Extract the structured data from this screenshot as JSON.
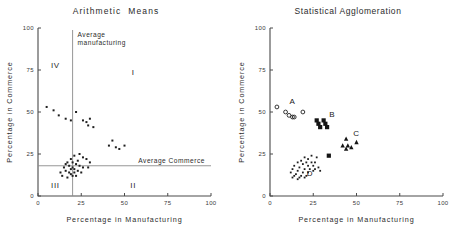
{
  "figure": {
    "panels": [
      "left",
      "right"
    ]
  },
  "left": {
    "title": "Arithmetic  Means",
    "xlabel": "Percentage in Manufacturing",
    "ylabel": "Percentage in Commerce",
    "ticks": [
      "0",
      "25",
      "50",
      "75",
      "100"
    ],
    "annotations": {
      "avg_manufacturing": "Average\nmanufacturing",
      "avg_manufacturing_line1": "Average",
      "avg_manufacturing_line2": "manufacturing",
      "avg_commerce": "Average Commerce"
    },
    "quadrants": {
      "one": "I",
      "two": "II",
      "three": "III",
      "four": "IV"
    }
  },
  "right": {
    "title": "Statistical Agglomeration",
    "xlabel": "Percentage in Manufacturing",
    "ylabel": "Percentage in Commerce",
    "ticks": [
      "0",
      "25",
      "50",
      "75",
      "100"
    ],
    "clusters": {
      "a": "A",
      "b": "B",
      "c": "C",
      "d": "D"
    }
  },
  "chart_data": [
    {
      "type": "scatter",
      "title": "Arithmetic  Means",
      "xlabel": "Percentage in Manufacturing",
      "ylabel": "Percentage in Commerce",
      "xlim": [
        0,
        100
      ],
      "ylim": [
        0,
        100
      ],
      "xticks": [
        0,
        25,
        50,
        75,
        100
      ],
      "yticks": [
        0,
        25,
        50,
        75,
        100
      ],
      "grid": false,
      "legend": "none",
      "reference_lines": [
        {
          "orientation": "vertical",
          "value": 20,
          "label": "Average manufacturing"
        },
        {
          "orientation": "horizontal",
          "value": 18,
          "label": "Average Commerce"
        }
      ],
      "annotations": [
        {
          "text": "IV",
          "x": 10,
          "y": 76
        },
        {
          "text": "I",
          "x": 55,
          "y": 72
        },
        {
          "text": "II",
          "x": 55,
          "y": 5
        },
        {
          "text": "III",
          "x": 10,
          "y": 5
        }
      ],
      "points": [
        {
          "x": 5,
          "y": 53
        },
        {
          "x": 9,
          "y": 51
        },
        {
          "x": 12,
          "y": 48
        },
        {
          "x": 16,
          "y": 46
        },
        {
          "x": 19,
          "y": 45
        },
        {
          "x": 22,
          "y": 50
        },
        {
          "x": 26,
          "y": 45
        },
        {
          "x": 28,
          "y": 44
        },
        {
          "x": 30,
          "y": 46
        },
        {
          "x": 29,
          "y": 42
        },
        {
          "x": 32,
          "y": 41
        },
        {
          "x": 43,
          "y": 33
        },
        {
          "x": 41,
          "y": 30
        },
        {
          "x": 45,
          "y": 29
        },
        {
          "x": 47,
          "y": 28
        },
        {
          "x": 50,
          "y": 30
        },
        {
          "x": 21,
          "y": 24
        },
        {
          "x": 24,
          "y": 25
        },
        {
          "x": 26,
          "y": 23
        },
        {
          "x": 28,
          "y": 22
        },
        {
          "x": 30,
          "y": 20
        },
        {
          "x": 29,
          "y": 17
        },
        {
          "x": 19,
          "y": 22
        },
        {
          "x": 20,
          "y": 20
        },
        {
          "x": 22,
          "y": 19
        },
        {
          "x": 23,
          "y": 21
        },
        {
          "x": 17,
          "y": 20
        },
        {
          "x": 18,
          "y": 18
        },
        {
          "x": 20,
          "y": 17
        },
        {
          "x": 21,
          "y": 16
        },
        {
          "x": 24,
          "y": 18
        },
        {
          "x": 26,
          "y": 17
        },
        {
          "x": 15,
          "y": 17
        },
        {
          "x": 16,
          "y": 15
        },
        {
          "x": 18,
          "y": 14
        },
        {
          "x": 19,
          "y": 13
        },
        {
          "x": 21,
          "y": 14
        },
        {
          "x": 23,
          "y": 15
        },
        {
          "x": 25,
          "y": 14
        },
        {
          "x": 13,
          "y": 14
        },
        {
          "x": 14,
          "y": 12
        },
        {
          "x": 17,
          "y": 11
        },
        {
          "x": 20,
          "y": 12
        },
        {
          "x": 22,
          "y": 12
        },
        {
          "x": 16,
          "y": 19
        },
        {
          "x": 19,
          "y": 16
        }
      ]
    },
    {
      "type": "scatter",
      "title": "Statistical Agglomeration",
      "xlabel": "Percentage in Manufacturing",
      "ylabel": "Percentage in Commerce",
      "xlim": [
        0,
        100
      ],
      "ylim": [
        0,
        100
      ],
      "xticks": [
        0,
        25,
        50,
        75,
        100
      ],
      "yticks": [
        0,
        25,
        50,
        75,
        100
      ],
      "grid": false,
      "legend": "none",
      "annotations": [
        {
          "text": "A",
          "x": 13,
          "y": 55
        },
        {
          "text": "B",
          "x": 36,
          "y": 47
        },
        {
          "text": "C",
          "x": 50,
          "y": 36
        },
        {
          "text": "D",
          "x": 23,
          "y": 12
        }
      ],
      "series": [
        {
          "name": "A",
          "marker": "open-circle",
          "points": [
            {
              "x": 4,
              "y": 53
            },
            {
              "x": 9,
              "y": 50
            },
            {
              "x": 11,
              "y": 48
            },
            {
              "x": 13,
              "y": 47
            },
            {
              "x": 14,
              "y": 47
            },
            {
              "x": 19,
              "y": 50
            }
          ]
        },
        {
          "name": "B",
          "marker": "filled-square",
          "points": [
            {
              "x": 27,
              "y": 45
            },
            {
              "x": 31,
              "y": 45
            },
            {
              "x": 28,
              "y": 43
            },
            {
              "x": 32,
              "y": 43
            },
            {
              "x": 29,
              "y": 41
            },
            {
              "x": 33,
              "y": 41
            },
            {
              "x": 34,
              "y": 24
            }
          ]
        },
        {
          "name": "C",
          "marker": "filled-triangle",
          "points": [
            {
              "x": 44,
              "y": 34
            },
            {
              "x": 42,
              "y": 30
            },
            {
              "x": 45,
              "y": 30
            },
            {
              "x": 47,
              "y": 29
            },
            {
              "x": 44,
              "y": 28
            },
            {
              "x": 50,
              "y": 32
            }
          ]
        },
        {
          "name": "D",
          "marker": "small-dot",
          "points": [
            {
              "x": 24,
              "y": 24
            },
            {
              "x": 27,
              "y": 23
            },
            {
              "x": 20,
              "y": 23
            },
            {
              "x": 22,
              "y": 22
            },
            {
              "x": 18,
              "y": 21
            },
            {
              "x": 21,
              "y": 20
            },
            {
              "x": 24,
              "y": 20
            },
            {
              "x": 26,
              "y": 20
            },
            {
              "x": 16,
              "y": 20
            },
            {
              "x": 19,
              "y": 19
            },
            {
              "x": 22,
              "y": 18
            },
            {
              "x": 25,
              "y": 18
            },
            {
              "x": 28,
              "y": 17
            },
            {
              "x": 14,
              "y": 18
            },
            {
              "x": 17,
              "y": 17
            },
            {
              "x": 20,
              "y": 16
            },
            {
              "x": 23,
              "y": 16
            },
            {
              "x": 26,
              "y": 16
            },
            {
              "x": 13,
              "y": 16
            },
            {
              "x": 16,
              "y": 15
            },
            {
              "x": 19,
              "y": 14
            },
            {
              "x": 22,
              "y": 14
            },
            {
              "x": 25,
              "y": 15
            },
            {
              "x": 29,
              "y": 15
            },
            {
              "x": 12,
              "y": 14
            },
            {
              "x": 15,
              "y": 13
            },
            {
              "x": 18,
              "y": 12
            },
            {
              "x": 21,
              "y": 12
            },
            {
              "x": 14,
              "y": 12
            },
            {
              "x": 17,
              "y": 11
            },
            {
              "x": 20,
              "y": 11
            },
            {
              "x": 13,
              "y": 11
            },
            {
              "x": 16,
              "y": 10
            }
          ]
        }
      ]
    }
  ]
}
